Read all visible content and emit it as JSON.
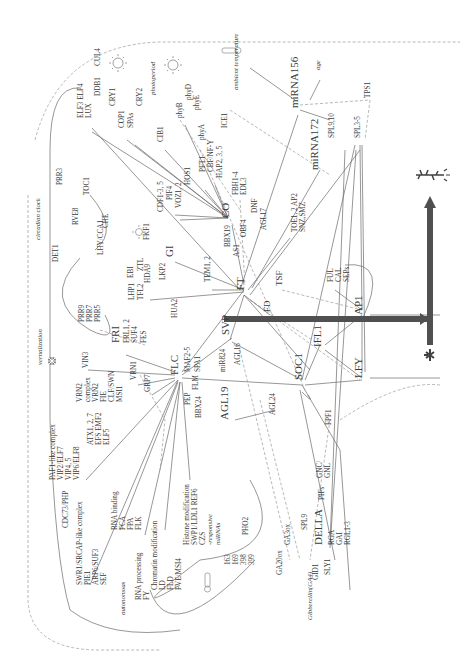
{
  "diagram": {
    "orientation": "rotated-90-clockwise",
    "arrow_label": "transition to flowering",
    "colors": {
      "line": "#6a6a6a",
      "dashed": "#9a9a9a",
      "text": "#3a3a3a",
      "main_arrow": "#505050"
    },
    "pathways": {
      "photoperiod": "photoperiod",
      "circadian_clock": "circadian clock",
      "vernalization": "vernalization",
      "autonomous": "autonomous",
      "ambient_temperature": "ambient temperature",
      "age": "age",
      "gibberellin": "Gibberellin(GA4)"
    },
    "nodes": [
      {
        "id": "elf3",
        "label": "ELF3 ELF4",
        "x": 83,
        "y": 118,
        "size": "label"
      },
      {
        "id": "lux",
        "label": "LUX",
        "x": 91,
        "y": 118,
        "size": "label"
      },
      {
        "id": "ddb1",
        "label": "DDB1",
        "x": 100,
        "y": 96,
        "size": "label"
      },
      {
        "id": "cul4",
        "label": "CUL4",
        "x": 100,
        "y": 66,
        "size": "label"
      },
      {
        "id": "cry1",
        "label": "CRY1",
        "x": 115,
        "y": 106,
        "size": "label"
      },
      {
        "id": "cry2",
        "label": "CRY2",
        "x": 142,
        "y": 106,
        "size": "label"
      },
      {
        "id": "cop1",
        "label": "COP1",
        "x": 124,
        "y": 128,
        "size": "label"
      },
      {
        "id": "spas",
        "label": "SPAs",
        "x": 133,
        "y": 128,
        "size": "label"
      },
      {
        "id": "cib1",
        "label": "CIB1",
        "x": 163,
        "y": 142,
        "size": "label"
      },
      {
        "id": "phyb",
        "label": "phyB",
        "x": 182,
        "y": 118,
        "size": "label"
      },
      {
        "id": "phyd",
        "label": "phyD",
        "x": 191,
        "y": 100,
        "size": "label"
      },
      {
        "id": "phye",
        "label": "phyE",
        "x": 199,
        "y": 110,
        "size": "label"
      },
      {
        "id": "phya",
        "label": "phyA",
        "x": 204,
        "y": 140,
        "size": "label"
      },
      {
        "id": "ice1",
        "label": "ICE1",
        "x": 227,
        "y": 128,
        "size": "label"
      },
      {
        "id": "hos1",
        "label": "HOS1",
        "x": 190,
        "y": 185,
        "size": "label"
      },
      {
        "id": "pft1",
        "label": "PFT1",
        "x": 205,
        "y": 172,
        "size": "label"
      },
      {
        "id": "cbfnfy",
        "label": "CBF/NF-Y",
        "x": 213,
        "y": 172,
        "size": "label"
      },
      {
        "id": "hap",
        "label": "HAP2, 3, 5",
        "x": 222,
        "y": 178,
        "size": "label"
      },
      {
        "id": "fbh",
        "label": "FBH1-4",
        "x": 238,
        "y": 195,
        "size": "label"
      },
      {
        "id": "edl3",
        "label": "EDL3",
        "x": 246,
        "y": 195,
        "size": "label"
      },
      {
        "id": "cdf",
        "label": "CDF1-3, 5",
        "x": 163,
        "y": 212,
        "size": "label"
      },
      {
        "id": "fkf1",
        "label": "FKF1",
        "x": 149,
        "y": 240,
        "size": "label"
      },
      {
        "id": "pif4",
        "label": "PIF4",
        "x": 172,
        "y": 200,
        "size": "label"
      },
      {
        "id": "vozm",
        "label": "VOZ1, 2",
        "x": 181,
        "y": 208,
        "size": "label"
      },
      {
        "id": "co",
        "label": "CO",
        "x": 229,
        "y": 218,
        "size": "big"
      },
      {
        "id": "dnf",
        "label": "DNF",
        "x": 257,
        "y": 213,
        "size": "label"
      },
      {
        "id": "bbx19",
        "label": "BBX19",
        "x": 230,
        "y": 247,
        "size": "label"
      },
      {
        "id": "obf4",
        "label": "OBF4",
        "x": 246,
        "y": 237,
        "size": "label"
      },
      {
        "id": "agl17",
        "label": "AGL17",
        "x": 266,
        "y": 230,
        "size": "label"
      },
      {
        "id": "gi",
        "label": "GI",
        "x": 173,
        "y": 257,
        "size": "big"
      },
      {
        "id": "as1",
        "label": "AS1",
        "x": 239,
        "y": 257,
        "size": "label"
      },
      {
        "id": "prr3",
        "label": "PRR3",
        "x": 62,
        "y": 185,
        "size": "label"
      },
      {
        "id": "toc1",
        "label": "TOC1",
        "x": 89,
        "y": 195,
        "size": "label"
      },
      {
        "id": "rve8",
        "label": "RVE8",
        "x": 78,
        "y": 225,
        "size": "label"
      },
      {
        "id": "lhy",
        "label": "LHY/CCA1",
        "x": 103,
        "y": 255,
        "size": "label"
      },
      {
        "id": "che",
        "label": "CHE",
        "x": 108,
        "y": 228,
        "size": "label"
      },
      {
        "id": "det1",
        "label": "DET1",
        "x": 58,
        "y": 262,
        "size": "label"
      },
      {
        "id": "ztl",
        "label": "ZTL",
        "x": 143,
        "y": 271,
        "size": "label"
      },
      {
        "id": "ebi",
        "label": "EBI",
        "x": 133,
        "y": 278,
        "size": "label"
      },
      {
        "id": "hda9",
        "label": "HDA9",
        "x": 150,
        "y": 283,
        "size": "label"
      },
      {
        "id": "lkp2",
        "label": "LKP2",
        "x": 165,
        "y": 280,
        "size": "label"
      },
      {
        "id": "lhp1",
        "label": "LHP1",
        "x": 134,
        "y": 300,
        "size": "label"
      },
      {
        "id": "tfl2",
        "label": "TFL2",
        "x": 143,
        "y": 300,
        "size": "label"
      },
      {
        "id": "tem",
        "label": "TEM1, 2",
        "x": 210,
        "y": 282,
        "size": "label"
      },
      {
        "id": "ft",
        "label": "FT",
        "x": 244,
        "y": 290,
        "size": "big"
      },
      {
        "id": "tsf",
        "label": "TSF",
        "x": 282,
        "y": 286,
        "size": "mid"
      },
      {
        "id": "fd",
        "label": "FD",
        "x": 270,
        "y": 312,
        "size": "mid"
      },
      {
        "id": "prr9",
        "label": "PRR9",
        "x": 84,
        "y": 322,
        "size": "label"
      },
      {
        "id": "prr7",
        "label": "PRR7",
        "x": 92,
        "y": 322,
        "size": "label"
      },
      {
        "id": "prr5",
        "label": "PRR5",
        "x": 100,
        "y": 322,
        "size": "label"
      },
      {
        "id": "hua2",
        "label": "HUA2",
        "x": 177,
        "y": 318,
        "size": "label"
      },
      {
        "id": "fri",
        "label": "FRI",
        "x": 119,
        "y": 343,
        "size": "big"
      },
      {
        "id": "frl1",
        "label": "FRL1, 2",
        "x": 129,
        "y": 343,
        "size": "label"
      },
      {
        "id": "suf4",
        "label": "SUF4",
        "x": 137,
        "y": 343,
        "size": "label"
      },
      {
        "id": "fes",
        "label": "FES",
        "x": 146,
        "y": 343,
        "size": "label"
      },
      {
        "id": "svp",
        "label": "SVP",
        "x": 229,
        "y": 335,
        "size": "big"
      },
      {
        "id": "mir824",
        "label": "miR824",
        "x": 225,
        "y": 372,
        "size": "label"
      },
      {
        "id": "agl16",
        "label": "AGL16",
        "x": 240,
        "y": 365,
        "size": "label"
      },
      {
        "id": "vin3",
        "label": "VIN3",
        "x": 88,
        "y": 368,
        "size": "label"
      },
      {
        "id": "vrn2c",
        "label": "VRN2",
        "x": 82,
        "y": 402,
        "size": "label"
      },
      {
        "id": "complex",
        "label": "complex",
        "x": 90,
        "y": 402,
        "size": "label"
      },
      {
        "id": "vrn2",
        "label": "VRN2",
        "x": 98,
        "y": 402,
        "size": "label"
      },
      {
        "id": "fie",
        "label": "FIE",
        "x": 106,
        "y": 402,
        "size": "label"
      },
      {
        "id": "clfswn",
        "label": "CLF/SWN",
        "x": 114,
        "y": 402,
        "size": "label"
      },
      {
        "id": "msi1",
        "label": "MSI1",
        "x": 122,
        "y": 402,
        "size": "label"
      },
      {
        "id": "vrn1",
        "label": "VRN1",
        "x": 136,
        "y": 380,
        "size": "label"
      },
      {
        "id": "grp7",
        "label": "GRP7",
        "x": 150,
        "y": 392,
        "size": "label"
      },
      {
        "id": "flc",
        "label": "FLC",
        "x": 178,
        "y": 375,
        "size": "big"
      },
      {
        "id": "maf",
        "label": "MAF2-5",
        "x": 190,
        "y": 372,
        "size": "label"
      },
      {
        "id": "spa1",
        "label": "SPA1",
        "x": 200,
        "y": 372,
        "size": "label"
      },
      {
        "id": "flm",
        "label": "FLM",
        "x": 198,
        "y": 390,
        "size": "label"
      },
      {
        "id": "pep",
        "label": "PEP",
        "x": 190,
        "y": 405,
        "size": "label"
      },
      {
        "id": "bbx24",
        "label": "BBX24",
        "x": 201,
        "y": 418,
        "size": "label"
      },
      {
        "id": "agl19",
        "label": "AGL19",
        "x": 228,
        "y": 420,
        "size": "big"
      },
      {
        "id": "agl24",
        "label": "AGL24",
        "x": 275,
        "y": 415,
        "size": "label"
      },
      {
        "id": "soc1",
        "label": "SOC1",
        "x": 302,
        "y": 380,
        "size": "big"
      },
      {
        "id": "ifl1",
        "label": "IFL1",
        "x": 321,
        "y": 347,
        "size": "big"
      },
      {
        "id": "ful",
        "label": "FUL",
        "x": 333,
        "y": 282,
        "size": "label"
      },
      {
        "id": "cal",
        "label": "CAL",
        "x": 341,
        "y": 282,
        "size": "label"
      },
      {
        "id": "seps",
        "label": "SEPs",
        "x": 349,
        "y": 282,
        "size": "label"
      },
      {
        "id": "ap1",
        "label": "AP1",
        "x": 362,
        "y": 315,
        "size": "big"
      },
      {
        "id": "lfy",
        "label": "LFY",
        "x": 362,
        "y": 378,
        "size": "big"
      },
      {
        "id": "toe",
        "label": "TOE1, 2 AP2",
        "x": 297,
        "y": 232,
        "size": "label"
      },
      {
        "id": "snz",
        "label": "SNZ,SMZ",
        "x": 305,
        "y": 232,
        "size": "label"
      },
      {
        "id": "mir172",
        "label": "miRNA172",
        "x": 318,
        "y": 170,
        "size": "big"
      },
      {
        "id": "mir156",
        "label": "miRNA156",
        "x": 298,
        "y": 108,
        "size": "big"
      },
      {
        "id": "spl910",
        "label": "SPL9,10",
        "x": 334,
        "y": 138,
        "size": "label"
      },
      {
        "id": "spl35",
        "label": "SPL3-5",
        "x": 360,
        "y": 138,
        "size": "label"
      },
      {
        "id": "tps1",
        "label": "TPS1",
        "x": 370,
        "y": 98,
        "size": "label"
      },
      {
        "id": "atx",
        "label": "ATX1, 2, 7",
        "x": 93,
        "y": 445,
        "size": "label"
      },
      {
        "id": "efs",
        "label": "EFS EMF2",
        "x": 101,
        "y": 445,
        "size": "label"
      },
      {
        "id": "elf5",
        "label": "ELF5",
        "x": 109,
        "y": 445,
        "size": "label"
      },
      {
        "id": "paf1",
        "label": "PAF1-like complex",
        "x": 55,
        "y": 480,
        "size": "label"
      },
      {
        "id": "vip2",
        "label": "VIP2/ELF7",
        "x": 63,
        "y": 480,
        "size": "label"
      },
      {
        "id": "vip45",
        "label": "VIP4, 5",
        "x": 71,
        "y": 480,
        "size": "label"
      },
      {
        "id": "vip6",
        "label": "VIP6/ELF8",
        "x": 79,
        "y": 480,
        "size": "label"
      },
      {
        "id": "cdc73",
        "label": "CDC73/PHP",
        "x": 68,
        "y": 528,
        "size": "label"
      },
      {
        "id": "swr1",
        "label": "SWR1/SRCAP-like complex",
        "x": 82,
        "y": 585,
        "size": "label"
      },
      {
        "id": "pie1",
        "label": "PIE1",
        "x": 90,
        "y": 585,
        "size": "label"
      },
      {
        "id": "arp6",
        "label": "ARP6/SUF3",
        "x": 98,
        "y": 585,
        "size": "label"
      },
      {
        "id": "sef",
        "label": "SEF",
        "x": 106,
        "y": 585,
        "size": "label"
      },
      {
        "id": "rnab",
        "label": "RNA binding",
        "x": 117,
        "y": 530,
        "size": "label"
      },
      {
        "id": "fca",
        "label": "FCA",
        "x": 125,
        "y": 530,
        "size": "label"
      },
      {
        "id": "fpa",
        "label": "FPA",
        "x": 133,
        "y": 530,
        "size": "label"
      },
      {
        "id": "flk",
        "label": "FLK",
        "x": 141,
        "y": 530,
        "size": "label"
      },
      {
        "id": "rnap",
        "label": "RNA processing",
        "x": 141,
        "y": 600,
        "size": "label"
      },
      {
        "id": "fy",
        "label": "FY",
        "x": 149,
        "y": 600,
        "size": "label"
      },
      {
        "id": "chrom",
        "label": "Chromatin modification",
        "x": 157,
        "y": 590,
        "size": "label"
      },
      {
        "id": "ld",
        "label": "LD",
        "x": 165,
        "y": 590,
        "size": "label"
      },
      {
        "id": "fld",
        "label": "FLD",
        "x": 173,
        "y": 590,
        "size": "label"
      },
      {
        "id": "fve",
        "label": "FVE/MSI4",
        "x": 181,
        "y": 590,
        "size": "label"
      },
      {
        "id": "histone",
        "label": "Histone modification",
        "x": 189,
        "y": 545,
        "size": "label"
      },
      {
        "id": "swp1",
        "label": "SWP1/LDL1 REF6",
        "x": 197,
        "y": 545,
        "size": "label"
      },
      {
        "id": "czs",
        "label": "CZS",
        "x": 205,
        "y": 545,
        "size": "label"
      },
      {
        "id": "resp",
        "label": "-responsive",
        "x": 212,
        "y": 545,
        "size": "ital"
      },
      {
        "id": "mirnas",
        "label": "miRNAs",
        "x": 220,
        "y": 545,
        "size": "ital"
      },
      {
        "id": "m163",
        "label": "163",
        "x": 230,
        "y": 565,
        "size": "label"
      },
      {
        "id": "m169",
        "label": "169",
        "x": 238,
        "y": 565,
        "size": "label"
      },
      {
        "id": "m398",
        "label": "398",
        "x": 246,
        "y": 565,
        "size": "label"
      },
      {
        "id": "m399",
        "label": "399",
        "x": 254,
        "y": 565,
        "size": "label"
      },
      {
        "id": "pho2",
        "label": "PHO2",
        "x": 248,
        "y": 535,
        "size": "label"
      },
      {
        "id": "ga20ox",
        "label": "GA20ox",
        "x": 282,
        "y": 575,
        "size": "label"
      },
      {
        "id": "ga3ox",
        "label": "GA3ox",
        "x": 290,
        "y": 545,
        "size": "label"
      },
      {
        "id": "gid1",
        "label": "GID1",
        "x": 318,
        "y": 580,
        "size": "label"
      },
      {
        "id": "spl9",
        "label": "SPL9",
        "x": 307,
        "y": 530,
        "size": "label"
      },
      {
        "id": "della",
        "label": "DELLA",
        "x": 322,
        "y": 545,
        "size": "big"
      },
      {
        "id": "sly1",
        "label": "SLY1",
        "x": 330,
        "y": 575,
        "size": "label"
      },
      {
        "id": "rga",
        "label": "RGA",
        "x": 334,
        "y": 545,
        "size": "label"
      },
      {
        "id": "gai",
        "label": "GAI",
        "x": 342,
        "y": 545,
        "size": "label"
      },
      {
        "id": "rgl",
        "label": "RGL1-3",
        "x": 350,
        "y": 545,
        "size": "label"
      },
      {
        "id": "pifs",
        "label": "PIFs",
        "x": 324,
        "y": 500,
        "size": "label"
      },
      {
        "id": "gnc",
        "label": "GNC/",
        "x": 322,
        "y": 478,
        "size": "label"
      },
      {
        "id": "gnl",
        "label": "GNL",
        "x": 330,
        "y": 478,
        "size": "label"
      },
      {
        "id": "fpf1",
        "label": "FPF1",
        "x": 331,
        "y": 425,
        "size": "label"
      }
    ],
    "pathway_labels": [
      {
        "key": "photoperiod",
        "x": 155,
        "y": 95
      },
      {
        "key": "circadian_clock",
        "x": 40,
        "y": 240
      },
      {
        "key": "vernalization",
        "x": 42,
        "y": 365
      },
      {
        "key": "autonomous",
        "x": 125,
        "y": 615
      },
      {
        "key": "ambient_temperature",
        "x": 238,
        "y": 90
      },
      {
        "key": "age",
        "x": 320,
        "y": 70
      },
      {
        "key": "gibberellin",
        "x": 312,
        "y": 620
      }
    ]
  }
}
